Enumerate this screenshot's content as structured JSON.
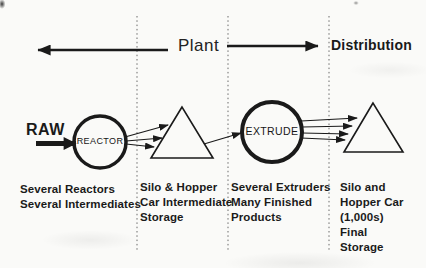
{
  "colors": {
    "ink": "#1a1a1a",
    "guide_line": "#6b6b6b",
    "background": "#fafaf8"
  },
  "header": {
    "plant": "Plant",
    "distribution": "Distribution"
  },
  "nodes": {
    "raw": "RAW",
    "reactor": "REACTOR",
    "extrude": "EXTRUDE"
  },
  "captions": {
    "reactors": [
      "Several Reactors",
      "Several Intermediates"
    ],
    "intermediate_storage": [
      "Silo & Hopper",
      "Car Intermediate",
      "Storage"
    ],
    "extruders": [
      "Several Extruders",
      "Many Finished",
      "Products"
    ],
    "final_storage": [
      "Silo and",
      "Hopper Car",
      "(1,000s)",
      "Final",
      "Storage"
    ]
  }
}
